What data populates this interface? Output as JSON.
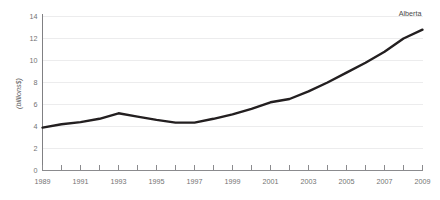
{
  "chart_data": {
    "type": "line",
    "title": "",
    "subtitle": "",
    "xlabel": "",
    "ylabel": "(billions$)",
    "xlim": [
      1989,
      2009
    ],
    "ylim": [
      0,
      14
    ],
    "grid": true,
    "grid_axis": "y",
    "legend_position": "inline-end-of-line",
    "series_label": "Alberta",
    "line_color": "#231f20",
    "grid_color": "#ececed",
    "axis_color": "#808083",
    "text_color": "#737373",
    "x": [
      1989,
      1990,
      1991,
      1992,
      1993,
      1994,
      1995,
      1996,
      1997,
      1998,
      1999,
      2000,
      2001,
      2002,
      2003,
      2004,
      2005,
      2006,
      2007,
      2008,
      2009
    ],
    "series": [
      {
        "name": "Alberta",
        "values": [
          3.9,
          4.2,
          4.4,
          4.7,
          5.2,
          4.9,
          4.6,
          4.35,
          4.35,
          4.7,
          5.1,
          5.6,
          6.2,
          6.5,
          7.2,
          8.0,
          8.9,
          9.8,
          10.8,
          12.0,
          12.8
        ]
      }
    ],
    "y_ticks": [
      0,
      2,
      4,
      6,
      8,
      10,
      12,
      14
    ],
    "y_tick_labels": [
      "0",
      "2",
      "4",
      "6",
      "8",
      "10",
      "12",
      "14"
    ],
    "x_ticks": [
      1989,
      1990,
      1991,
      1992,
      1993,
      1994,
      1995,
      1996,
      1997,
      1998,
      1999,
      2000,
      2001,
      2002,
      2003,
      2004,
      2005,
      2006,
      2007,
      2008,
      2009
    ],
    "x_tick_labels_shown": [
      "1989",
      "1991",
      "1993",
      "1995",
      "1997",
      "1999",
      "2001",
      "2003",
      "2005",
      "2007",
      "2009"
    ],
    "x_tick_label_interval": 2
  }
}
